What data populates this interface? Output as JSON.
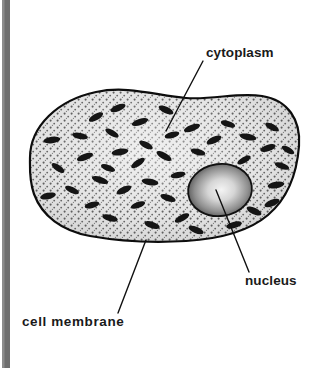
{
  "page": {
    "width": 317,
    "height": 368,
    "background_color": "#ffffff"
  },
  "margin_bar": {
    "name": "page-edge-bar",
    "color": "#6e6e6e",
    "x": 2,
    "width": 8
  },
  "labels": {
    "cytoplasm": {
      "text": "cytoplasm",
      "x": 206,
      "y": 57,
      "weight": "regular",
      "color": "#1a1a1a"
    },
    "nucleus": {
      "text": "nucleus",
      "x": 245,
      "y": 285,
      "weight": "regular",
      "color": "#1a1a1a"
    },
    "cell_membrane": {
      "text": "cell membrane",
      "x": 22,
      "y": 326,
      "weight": "bold",
      "color": "#1a1a1a"
    }
  },
  "leader_lines": [
    {
      "name": "leader-line-cytoplasm",
      "x1": 203,
      "y1": 61,
      "x2": 166,
      "y2": 131
    },
    {
      "name": "leader-line-nucleus",
      "x1": 216,
      "y1": 190,
      "x2": 249,
      "y2": 272
    },
    {
      "name": "leader-line-cell-membrane",
      "x1": 146,
      "y1": 240,
      "x2": 118,
      "y2": 313
    }
  ],
  "cell": {
    "name": "cell-body",
    "outline_color": "#0d0d0d",
    "outline_width": 2.2,
    "fill_color": "#dcdcdc",
    "stipple_color": "#3a3a3a",
    "bounds": {
      "x": 28,
      "y": 88,
      "width": 272,
      "height": 156
    }
  },
  "nucleus_shape": {
    "name": "nucleus-body",
    "cx": 220,
    "cy": 190,
    "rx": 32,
    "ry": 26,
    "rotation": -8,
    "center_color": "#f0f0f0",
    "edge_color": "#4a4a4a",
    "outline_color": "#111111"
  },
  "organelles": {
    "name": "mitochondria",
    "count": 42,
    "color": "#151515",
    "items": [
      {
        "cx": 52,
        "cy": 140,
        "rx": 8.5,
        "ry": 3.2,
        "rot": -8
      },
      {
        "cx": 80,
        "cy": 136,
        "rx": 8.0,
        "ry": 3.0,
        "rot": 12
      },
      {
        "cx": 85,
        "cy": 157,
        "rx": 8.5,
        "ry": 3.2,
        "rot": -20
      },
      {
        "cx": 58,
        "cy": 168,
        "rx": 7.5,
        "ry": 3.0,
        "rot": 35
      },
      {
        "cx": 48,
        "cy": 196,
        "rx": 8.0,
        "ry": 3.2,
        "rot": -12
      },
      {
        "cx": 72,
        "cy": 190,
        "rx": 7.5,
        "ry": 3.0,
        "rot": 25
      },
      {
        "cx": 96,
        "cy": 117,
        "rx": 8.0,
        "ry": 3.2,
        "rot": -30
      },
      {
        "cx": 100,
        "cy": 180,
        "rx": 8.5,
        "ry": 3.2,
        "rot": 18
      },
      {
        "cx": 92,
        "cy": 205,
        "rx": 7.5,
        "ry": 3.0,
        "rot": -15
      },
      {
        "cx": 118,
        "cy": 108,
        "rx": 8.0,
        "ry": 3.2,
        "rot": -22
      },
      {
        "cx": 112,
        "cy": 133,
        "rx": 7.5,
        "ry": 3.0,
        "rot": 30
      },
      {
        "cx": 120,
        "cy": 152,
        "rx": 8.5,
        "ry": 3.2,
        "rot": -10
      },
      {
        "cx": 108,
        "cy": 168,
        "rx": 7.5,
        "ry": 3.0,
        "rot": 22
      },
      {
        "cx": 124,
        "cy": 190,
        "rx": 8.0,
        "ry": 3.2,
        "rot": -25
      },
      {
        "cx": 110,
        "cy": 218,
        "rx": 8.0,
        "ry": 3.2,
        "rot": 15
      },
      {
        "cx": 140,
        "cy": 122,
        "rx": 8.5,
        "ry": 3.2,
        "rot": -18
      },
      {
        "cx": 146,
        "cy": 145,
        "rx": 7.5,
        "ry": 3.0,
        "rot": 28
      },
      {
        "cx": 138,
        "cy": 163,
        "rx": 8.0,
        "ry": 3.2,
        "rot": -35
      },
      {
        "cx": 150,
        "cy": 182,
        "rx": 8.5,
        "ry": 3.2,
        "rot": 10
      },
      {
        "cx": 138,
        "cy": 205,
        "rx": 7.5,
        "ry": 3.0,
        "rot": -20
      },
      {
        "cx": 152,
        "cy": 225,
        "rx": 8.0,
        "ry": 3.2,
        "rot": 18
      },
      {
        "cx": 166,
        "cy": 110,
        "rx": 8.0,
        "ry": 3.2,
        "rot": 25
      },
      {
        "cx": 172,
        "cy": 135,
        "rx": 7.5,
        "ry": 3.0,
        "rot": -15
      },
      {
        "cx": 164,
        "cy": 156,
        "rx": 8.5,
        "ry": 3.2,
        "rot": 30
      },
      {
        "cx": 178,
        "cy": 175,
        "rx": 7.5,
        "ry": 3.0,
        "rot": -12
      },
      {
        "cx": 168,
        "cy": 198,
        "rx": 8.0,
        "ry": 3.2,
        "rot": 20
      },
      {
        "cx": 182,
        "cy": 218,
        "rx": 8.0,
        "ry": 3.2,
        "rot": -28
      },
      {
        "cx": 192,
        "cy": 128,
        "rx": 8.5,
        "ry": 3.2,
        "rot": -20
      },
      {
        "cx": 198,
        "cy": 152,
        "rx": 7.5,
        "ry": 3.0,
        "rot": 15
      },
      {
        "cx": 196,
        "cy": 230,
        "rx": 8.0,
        "ry": 3.2,
        "rot": 22
      },
      {
        "cx": 214,
        "cy": 140,
        "rx": 8.0,
        "ry": 3.2,
        "rot": -25
      },
      {
        "cx": 228,
        "cy": 124,
        "rx": 7.5,
        "ry": 3.0,
        "rot": 18
      },
      {
        "cx": 234,
        "cy": 225,
        "rx": 8.0,
        "ry": 3.2,
        "rot": -15
      },
      {
        "cx": 248,
        "cy": 137,
        "rx": 8.5,
        "ry": 3.2,
        "rot": 12
      },
      {
        "cx": 244,
        "cy": 160,
        "rx": 7.5,
        "ry": 3.0,
        "rot": -30
      },
      {
        "cx": 254,
        "cy": 211,
        "rx": 8.0,
        "ry": 3.2,
        "rot": 25
      },
      {
        "cx": 268,
        "cy": 148,
        "rx": 8.0,
        "ry": 3.2,
        "rot": -18
      },
      {
        "cx": 272,
        "cy": 127,
        "rx": 7.5,
        "ry": 3.0,
        "rot": 28
      },
      {
        "cx": 276,
        "cy": 185,
        "rx": 8.5,
        "ry": 3.2,
        "rot": -10
      },
      {
        "cx": 282,
        "cy": 166,
        "rx": 7.5,
        "ry": 3.0,
        "rot": 20
      },
      {
        "cx": 272,
        "cy": 203,
        "rx": 8.0,
        "ry": 3.2,
        "rot": -22
      },
      {
        "cx": 288,
        "cy": 150,
        "rx": 7.0,
        "ry": 2.8,
        "rot": 30
      }
    ]
  }
}
